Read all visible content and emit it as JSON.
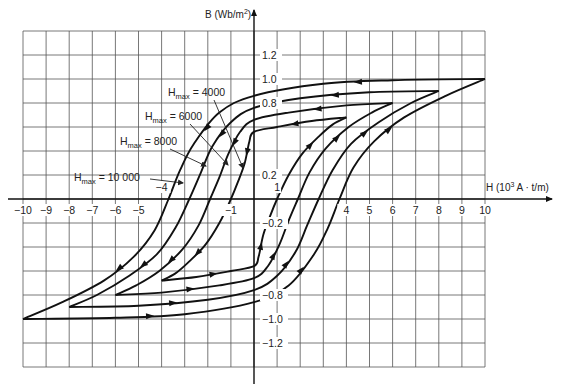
{
  "chart_data": {
    "type": "line",
    "title": "",
    "xlabel": "H (10³ A · t/m)",
    "xlabel_base": "H (10",
    "xlabel_sup": "3",
    "xlabel_rest": " A · t/m)",
    "ylabel": "B (Wb/m²)",
    "ylabel_base": "B (Wb/m",
    "ylabel_sup": "2",
    "ylabel_rest": ")",
    "xlim": [
      -10,
      10
    ],
    "ylim": [
      -1.4,
      1.4
    ],
    "grid": true,
    "x_ticks": [
      {
        "v": -10,
        "label": "−10"
      },
      {
        "v": -9,
        "label": "−9"
      },
      {
        "v": -8,
        "label": "−8"
      },
      {
        "v": -7,
        "label": "−7"
      },
      {
        "v": -6,
        "label": "−6"
      },
      {
        "v": -5,
        "label": "−5"
      },
      {
        "v": -4,
        "label": "−4",
        "above": true
      },
      {
        "v": -1,
        "label": "−1"
      },
      {
        "v": 1,
        "label": "1",
        "above": true
      },
      {
        "v": 4,
        "label": "4"
      },
      {
        "v": 5,
        "label": "5"
      },
      {
        "v": 6,
        "label": "6"
      },
      {
        "v": 7,
        "label": "7"
      },
      {
        "v": 8,
        "label": "8"
      },
      {
        "v": 9,
        "label": "9"
      },
      {
        "v": 10,
        "label": "10"
      }
    ],
    "y_ticks": [
      {
        "v": 1.2,
        "label": "1.2"
      },
      {
        "v": 1.0,
        "label": "1.0"
      },
      {
        "v": 0.8,
        "label": "0.8"
      },
      {
        "v": 0.2,
        "label": "0.2"
      },
      {
        "v": -0.2,
        "label": "−0.2"
      },
      {
        "v": -0.8,
        "label": "−0.8"
      },
      {
        "v": -1.0,
        "label": "−1.0"
      },
      {
        "v": -1.2,
        "label": "−1.2"
      }
    ],
    "series": [
      {
        "name": "Hmax = 10 000",
        "label": "H",
        "sub": "max",
        "value": " = 10 000",
        "label_pos": [
          3.0,
          0.1
        ],
        "arrow_to": [
          -3.1,
          0.12
        ],
        "tip": [
          10,
          1.0
        ],
        "remanence": 0.86,
        "coercive": 3.7,
        "descending": [
          [
            10,
            1.0
          ],
          [
            6,
            0.99
          ],
          [
            3,
            0.96
          ],
          [
            0,
            0.86
          ],
          [
            -1.5,
            0.72
          ],
          [
            -2.6,
            0.46
          ],
          [
            -3.2,
            0.24
          ],
          [
            -3.7,
            0
          ],
          [
            -4.3,
            -0.26
          ],
          [
            -5.2,
            -0.48
          ],
          [
            -6.5,
            -0.68
          ],
          [
            -8.3,
            -0.86
          ],
          [
            -10,
            -1.0
          ]
        ],
        "ascending": [
          [
            -10,
            -1.0
          ],
          [
            -6,
            -0.99
          ],
          [
            -3,
            -0.96
          ],
          [
            0,
            -0.86
          ],
          [
            1.5,
            -0.72
          ],
          [
            2.6,
            -0.46
          ],
          [
            3.2,
            -0.24
          ],
          [
            3.7,
            0
          ],
          [
            4.3,
            0.26
          ],
          [
            5.2,
            0.48
          ],
          [
            6.5,
            0.68
          ],
          [
            8.3,
            0.86
          ],
          [
            10,
            1.0
          ]
        ]
      },
      {
        "name": "Hmax = 8000",
        "label": "H",
        "sub": "max",
        "value": " = 8000",
        "label_pos": [
          1.9,
          0.46
        ],
        "arrow_to": [
          -2.1,
          0.27
        ],
        "tip": [
          8,
          0.9
        ],
        "remanence": 0.76,
        "coercive": 2.8,
        "descending": [
          [
            8,
            0.9
          ],
          [
            5,
            0.89
          ],
          [
            2,
            0.84
          ],
          [
            0,
            0.76
          ],
          [
            -1,
            0.64
          ],
          [
            -1.8,
            0.44
          ],
          [
            -2.3,
            0.22
          ],
          [
            -2.8,
            0
          ],
          [
            -3.4,
            -0.24
          ],
          [
            -4.2,
            -0.46
          ],
          [
            -5.4,
            -0.64
          ],
          [
            -6.8,
            -0.8
          ],
          [
            -8,
            -0.9
          ]
        ],
        "ascending": [
          [
            -8,
            -0.9
          ],
          [
            -5,
            -0.89
          ],
          [
            -2,
            -0.84
          ],
          [
            0,
            -0.76
          ],
          [
            1,
            -0.64
          ],
          [
            1.8,
            -0.44
          ],
          [
            2.3,
            -0.22
          ],
          [
            2.8,
            0
          ],
          [
            3.4,
            0.24
          ],
          [
            4.2,
            0.46
          ],
          [
            5.4,
            0.64
          ],
          [
            6.8,
            0.8
          ],
          [
            8,
            0.9
          ]
        ]
      },
      {
        "name": "Hmax = 6000",
        "label": "H",
        "sub": "max",
        "value": " = 6000",
        "label_pos": [
          -0.6,
          0.68
        ],
        "arrow_to": [
          -1.1,
          0.29
        ],
        "tip": [
          6,
          0.8
        ],
        "remanence": 0.66,
        "coercive": 1.9,
        "descending": [
          [
            6,
            0.8
          ],
          [
            4,
            0.78
          ],
          [
            1.5,
            0.72
          ],
          [
            0,
            0.66
          ],
          [
            -0.6,
            0.56
          ],
          [
            -1.1,
            0.38
          ],
          [
            -1.5,
            0.18
          ],
          [
            -1.9,
            0
          ],
          [
            -2.4,
            -0.22
          ],
          [
            -3.1,
            -0.42
          ],
          [
            -4.1,
            -0.6
          ],
          [
            -5.1,
            -0.72
          ],
          [
            -6,
            -0.8
          ]
        ],
        "ascending": [
          [
            -6,
            -0.8
          ],
          [
            -4,
            -0.78
          ],
          [
            -1.5,
            -0.72
          ],
          [
            0,
            -0.66
          ],
          [
            0.6,
            -0.56
          ],
          [
            1.1,
            -0.38
          ],
          [
            1.5,
            -0.18
          ],
          [
            1.9,
            0
          ],
          [
            2.4,
            0.22
          ],
          [
            3.1,
            0.42
          ],
          [
            4.1,
            0.6
          ],
          [
            5.1,
            0.72
          ],
          [
            6,
            0.8
          ]
        ]
      },
      {
        "name": "Hmax = 4000",
        "label": "H",
        "sub": "max",
        "value": " = 4000",
        "label_pos": [
          -0.9,
          0.88
        ],
        "arrow_to": [
          -0.4,
          0.26
        ],
        "tip": [
          4,
          0.68
        ],
        "remanence": 0.56,
        "coercive": 1.0,
        "descending": [
          [
            4,
            0.68
          ],
          [
            2.5,
            0.65
          ],
          [
            1,
            0.6
          ],
          [
            0,
            0.56
          ],
          [
            -0.2,
            0.48
          ],
          [
            -0.4,
            0.3
          ],
          [
            -0.7,
            0.14
          ],
          [
            -1.0,
            0
          ],
          [
            -1.5,
            -0.2
          ],
          [
            -2.1,
            -0.38
          ],
          [
            -2.8,
            -0.52
          ],
          [
            -3.4,
            -0.62
          ],
          [
            -4,
            -0.68
          ]
        ],
        "ascending": [
          [
            -4,
            -0.68
          ],
          [
            -2.5,
            -0.65
          ],
          [
            -1,
            -0.6
          ],
          [
            0,
            -0.56
          ],
          [
            0.2,
            -0.48
          ],
          [
            0.4,
            -0.3
          ],
          [
            0.7,
            -0.14
          ],
          [
            1.0,
            0
          ],
          [
            1.5,
            0.2
          ],
          [
            2.1,
            0.38
          ],
          [
            2.8,
            0.52
          ],
          [
            3.4,
            0.62
          ],
          [
            4,
            0.68
          ]
        ]
      }
    ]
  },
  "layout": {
    "x0": 23,
    "x1": 485,
    "y0": 31,
    "y1": 367,
    "origin_x": 254,
    "origin_y": 199
  }
}
